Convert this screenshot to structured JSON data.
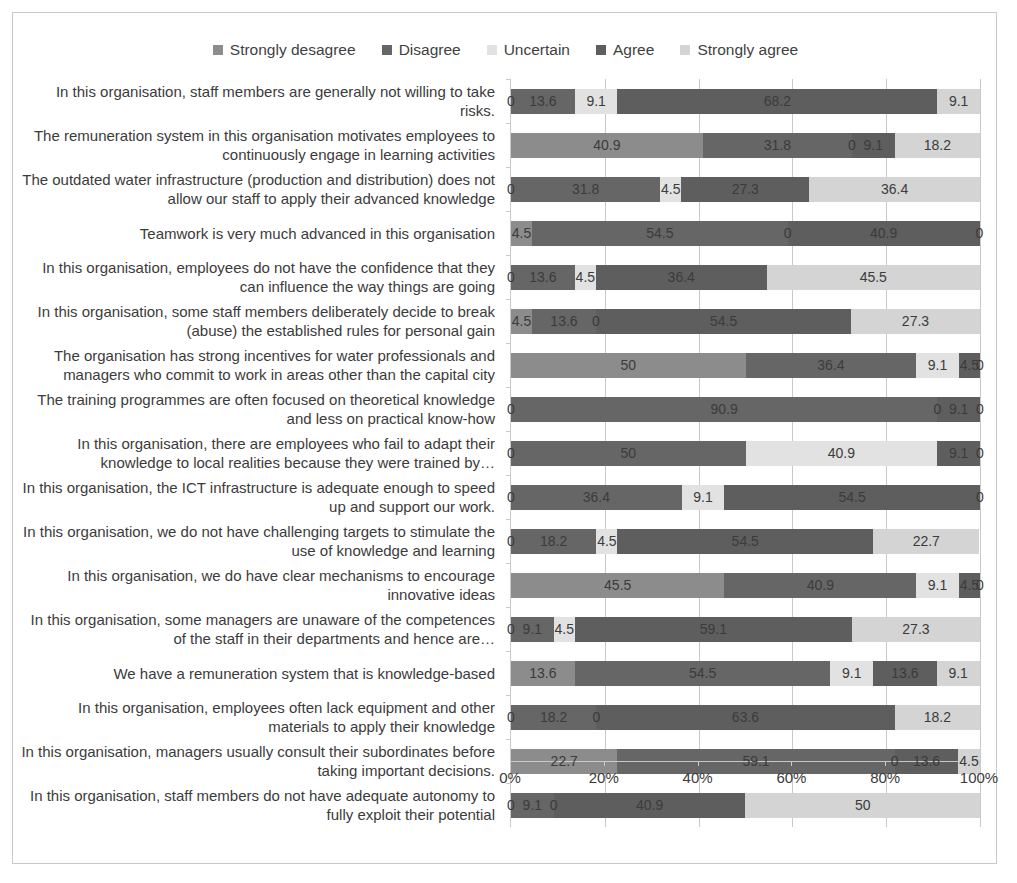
{
  "chart_data": {
    "type": "bar",
    "orientation": "horizontal",
    "stacked": true,
    "normalized_percent": true,
    "title": "",
    "xlabel": "",
    "ylabel": "",
    "xlim": [
      0,
      100
    ],
    "grid": true,
    "legend_position": "top-center",
    "xticks": [
      "0%",
      "20%",
      "40%",
      "60%",
      "80%",
      "100%"
    ],
    "xtick_values": [
      0,
      20,
      40,
      60,
      80,
      100
    ],
    "series": [
      {
        "name": "Strongly desagree",
        "color": "#8c8c8c",
        "values": [
          0,
          40.9,
          0,
          4.5,
          0,
          4.5,
          50,
          0,
          0,
          0,
          0,
          45.5,
          0,
          13.6,
          0,
          22.7,
          0
        ]
      },
      {
        "name": "Disagree",
        "color": "#666666",
        "values": [
          13.6,
          31.8,
          31.8,
          54.5,
          13.6,
          13.6,
          36.4,
          90.9,
          50,
          36.4,
          18.2,
          40.9,
          9.1,
          54.5,
          18.2,
          59.1,
          9.1
        ]
      },
      {
        "name": "Uncertain",
        "color": "#e2e2e2",
        "values": [
          9.1,
          0,
          4.5,
          0,
          4.5,
          0,
          9.1,
          0,
          40.9,
          9.1,
          4.5,
          9.1,
          4.5,
          9.1,
          0,
          0,
          0
        ]
      },
      {
        "name": "Agree",
        "color": "#5e5e5e",
        "values": [
          68.2,
          9.1,
          27.3,
          40.9,
          36.4,
          54.5,
          4.5,
          9.1,
          9.1,
          54.5,
          54.5,
          4.5,
          59.1,
          13.6,
          63.6,
          13.6,
          40.9
        ]
      },
      {
        "name": "Strongly agree",
        "color": "#d4d4d4",
        "values": [
          9.1,
          18.2,
          36.4,
          0,
          45.5,
          27.3,
          0,
          0,
          0,
          0,
          22.7,
          0,
          27.3,
          9.1,
          18.2,
          4.5,
          50
        ]
      }
    ],
    "categories": [
      "In this organisation, staff members are generally not willing to take risks.",
      "The remuneration system in this organisation motivates employees to continuously engage in learning activities",
      "The outdated water infrastructure (production and distribution) does not allow our staff to apply their advanced knowledge",
      "Teamwork is very much advanced in this organisation",
      "In this organisation, employees do not have the confidence that they can influence the way things are going",
      "In this organisation, some staff members deliberately decide to break (abuse) the established rules for personal gain",
      "The organisation has strong incentives for water professionals and managers who commit to work in areas other than the capital city",
      "The training programmes are often focused on theoretical knowledge and less on practical know-how",
      "In this organisation, there are employees who fail to adapt their knowledge to local realities because they were trained by…",
      "In this organisation, the ICT infrastructure is adequate enough to speed up and support our work.",
      "In this organisation, we do not have challenging targets to stimulate the use of knowledge and learning",
      "In this organisation, we do have clear mechanisms to encourage innovative ideas",
      "In this organisation, some managers are unaware of the competences of the staff in their departments and hence are…",
      "We have a remuneration system that is knowledge-based",
      "In this organisation, employees often lack equipment and other materials to apply their knowledge",
      "In this organisation, managers usually consult their subordinates before taking important decisions.",
      "In this organisation, staff members do not have adequate autonomy to fully exploit their potential"
    ],
    "data_labels": [
      [
        "0",
        "13.6",
        "9.1",
        "68.2",
        "9.1"
      ],
      [
        "40.9",
        "31.8",
        "0",
        "9.1",
        "18.2"
      ],
      [
        "0",
        "31.8",
        "4.5",
        "27.3",
        "36.4"
      ],
      [
        "4.5",
        "54.5",
        "0",
        "40.9",
        "0"
      ],
      [
        "0",
        "13.6",
        "4.5",
        "36.4",
        "45.5"
      ],
      [
        "4.5",
        "13.6",
        "0",
        "54.5",
        "27.3"
      ],
      [
        "50",
        "36.4",
        "9.1",
        "4.5",
        "0"
      ],
      [
        "0",
        "90.9",
        "0",
        "9.1",
        "0"
      ],
      [
        "0",
        "50",
        "40.9",
        "9.1",
        "0"
      ],
      [
        "0",
        "36.4",
        "9.1",
        "54.5",
        "0"
      ],
      [
        "0",
        "18.2",
        "4.5",
        "54.5",
        "22.7"
      ],
      [
        "45.5",
        "40.9",
        "9.1",
        "4.5",
        "0"
      ],
      [
        "0",
        "9.1",
        "4.5",
        "59.1",
        "27.3"
      ],
      [
        "13.6",
        "54.5",
        "9.1",
        "13.6",
        "9.1"
      ],
      [
        "0",
        "18.2",
        "0",
        "63.6",
        "18.2"
      ],
      [
        "22.7",
        "59.1",
        "0",
        "13.6",
        "4.5"
      ],
      [
        "0",
        "9.1",
        "0",
        "40.9",
        "50"
      ]
    ]
  }
}
